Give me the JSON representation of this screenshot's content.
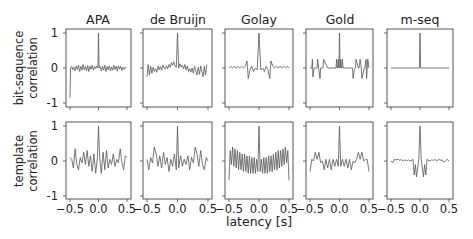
{
  "figure": {
    "xlabel": "latency [s]",
    "row_labels": [
      [
        "bit-sequence",
        "correlation"
      ],
      [
        "template",
        "correlation"
      ]
    ],
    "column_titles": [
      "APA",
      "de Bruijn",
      "Golay",
      "Gold",
      "m-seq"
    ],
    "xticks": [
      "-0.5",
      "0.0",
      "0.5"
    ],
    "yticks": [
      "1",
      "0",
      "-1"
    ],
    "line_color": "#555555",
    "frame_color": "#444444"
  },
  "chart_data": [
    {
      "type": "line",
      "title": "APA",
      "row": "bit-sequence correlation",
      "xlabel": "latency [s]",
      "ylabel": "bit-sequence correlation",
      "xlim": [
        -0.55,
        0.55
      ],
      "ylim": [
        -1.05,
        1.1
      ],
      "x": [
        -0.5,
        -0.49,
        -0.47,
        -0.45,
        -0.43,
        -0.41,
        -0.39,
        -0.37,
        -0.35,
        -0.33,
        -0.31,
        -0.29,
        -0.27,
        -0.25,
        -0.23,
        -0.21,
        -0.19,
        -0.17,
        -0.15,
        -0.13,
        -0.11,
        -0.09,
        -0.07,
        -0.05,
        -0.03,
        -0.01,
        0.0,
        0.01,
        0.03,
        0.05,
        0.07,
        0.09,
        0.11,
        0.13,
        0.15,
        0.17,
        0.19,
        0.21,
        0.23,
        0.25,
        0.27,
        0.29,
        0.31,
        0.33,
        0.35,
        0.37,
        0.39,
        0.41,
        0.43,
        0.45,
        0.47,
        0.49
      ],
      "y": [
        -0.85,
        0.0,
        0.05,
        -0.05,
        0.02,
        -0.08,
        0.06,
        -0.04,
        0.08,
        -0.1,
        0.05,
        -0.06,
        0.1,
        -0.05,
        0.04,
        -0.08,
        0.07,
        -0.1,
        0.05,
        -0.03,
        0.08,
        -0.06,
        0.04,
        -0.02,
        0.06,
        0.0,
        1.0,
        0.0,
        0.04,
        -0.08,
        0.05,
        -0.06,
        0.08,
        -0.1,
        0.04,
        -0.05,
        0.06,
        -0.08,
        0.03,
        -0.06,
        0.08,
        -0.04,
        0.05,
        -0.09,
        0.06,
        -0.03,
        0.05,
        -0.07,
        0.02,
        -0.04,
        0.03,
        0.0
      ]
    },
    {
      "type": "line",
      "title": "de Bruijn",
      "row": "bit-sequence correlation",
      "xlim": [
        -0.55,
        0.55
      ],
      "ylim": [
        -1.05,
        1.1
      ],
      "x": [
        -0.5,
        -0.48,
        -0.46,
        -0.44,
        -0.42,
        -0.4,
        -0.38,
        -0.36,
        -0.34,
        -0.32,
        -0.3,
        -0.28,
        -0.26,
        -0.24,
        -0.22,
        -0.2,
        -0.18,
        -0.16,
        -0.14,
        -0.12,
        -0.1,
        -0.08,
        -0.06,
        -0.04,
        -0.02,
        0.0,
        0.02,
        0.04,
        0.06,
        0.08,
        0.1,
        0.12,
        0.14,
        0.16,
        0.18,
        0.2,
        0.22,
        0.24,
        0.26,
        0.28,
        0.3,
        0.32,
        0.34,
        0.36,
        0.38,
        0.4,
        0.42,
        0.44,
        0.46,
        0.48
      ],
      "y": [
        -0.25,
        0.1,
        -0.2,
        0.05,
        -0.15,
        0.02,
        -0.1,
        -0.02,
        -0.12,
        0.05,
        -0.05,
        0.04,
        -0.06,
        0.08,
        0.0,
        -0.03,
        0.06,
        -0.02,
        0.1,
        0.02,
        0.15,
        0.08,
        0.18,
        0.05,
        0.02,
        1.0,
        0.0,
        0.12,
        0.03,
        0.08,
        -0.02,
        0.1,
        -0.05,
        0.06,
        -0.1,
        -0.02,
        -0.12,
        0.0,
        -0.15,
        0.05,
        -0.08,
        -0.2,
        0.02,
        -0.18,
        0.06,
        -0.1,
        -0.25,
        0.05,
        -0.2,
        0.1
      ]
    },
    {
      "type": "line",
      "title": "Golay",
      "row": "bit-sequence correlation",
      "xlim": [
        -0.55,
        0.55
      ],
      "ylim": [
        -1.05,
        1.1
      ],
      "x": [
        -0.5,
        -0.47,
        -0.44,
        -0.41,
        -0.38,
        -0.35,
        -0.32,
        -0.29,
        -0.26,
        -0.23,
        -0.2,
        -0.19,
        -0.18,
        -0.15,
        -0.12,
        -0.09,
        -0.06,
        -0.03,
        0.0,
        0.03,
        0.06,
        0.09,
        0.12,
        0.15,
        0.18,
        0.19,
        0.2,
        0.23,
        0.26,
        0.29,
        0.32,
        0.35,
        0.38,
        0.41,
        0.44,
        0.47,
        0.5
      ],
      "y": [
        0.0,
        0.05,
        0.0,
        0.05,
        0.0,
        0.05,
        0.0,
        0.05,
        0.0,
        0.05,
        0.2,
        0.0,
        -0.3,
        -0.05,
        0.05,
        -0.1,
        0.0,
        -0.05,
        1.0,
        -0.05,
        0.0,
        -0.1,
        0.05,
        -0.05,
        -0.3,
        0.0,
        0.2,
        0.05,
        0.0,
        0.05,
        0.0,
        0.05,
        0.0,
        0.05,
        0.0,
        0.05,
        0.0
      ]
    },
    {
      "type": "line",
      "title": "Gold",
      "row": "bit-sequence correlation",
      "xlim": [
        -0.55,
        0.55
      ],
      "ylim": [
        -1.05,
        1.1
      ],
      "x": [
        -0.5,
        -0.47,
        -0.46,
        -0.45,
        -0.43,
        -0.42,
        -0.38,
        -0.37,
        -0.35,
        -0.33,
        -0.32,
        -0.3,
        -0.28,
        -0.27,
        -0.2,
        -0.06,
        -0.05,
        -0.04,
        -0.03,
        -0.02,
        -0.01,
        0.0,
        0.01,
        0.02,
        0.03,
        0.04,
        0.05,
        0.06,
        0.2,
        0.22,
        0.23,
        0.25,
        0.27,
        0.28,
        0.32,
        0.33,
        0.35,
        0.37,
        0.38,
        0.42,
        0.43,
        0.45,
        0.46,
        0.47,
        0.48,
        0.5
      ],
      "y": [
        0.0,
        0.0,
        0.25,
        -0.25,
        0.0,
        0.0,
        0.0,
        0.25,
        -0.05,
        -0.3,
        0.0,
        0.0,
        0.0,
        0.25,
        0.0,
        0.0,
        0.25,
        0.0,
        0.0,
        0.25,
        0.0,
        1.0,
        0.0,
        0.25,
        0.0,
        0.0,
        0.25,
        0.0,
        0.0,
        0.0,
        -0.3,
        -0.05,
        0.0,
        0.25,
        0.0,
        0.0,
        0.25,
        0.0,
        -0.3,
        0.0,
        0.0,
        0.25,
        -0.3,
        0.0,
        0.25,
        0.0
      ]
    },
    {
      "type": "line",
      "title": "m-seq",
      "row": "bit-sequence correlation",
      "xlim": [
        -0.55,
        0.55
      ],
      "ylim": [
        -1.05,
        1.1
      ],
      "x": [
        -0.5,
        -0.01,
        0.0,
        0.01,
        0.5
      ],
      "y": [
        0.0,
        0.0,
        1.0,
        0.0,
        0.0
      ]
    },
    {
      "type": "line",
      "title": "APA",
      "row": "template correlation",
      "xlim": [
        -0.55,
        0.55
      ],
      "ylim": [
        -1.05,
        1.1
      ],
      "x": [
        -0.5,
        -0.47,
        -0.44,
        -0.41,
        -0.38,
        -0.35,
        -0.32,
        -0.29,
        -0.26,
        -0.23,
        -0.2,
        -0.17,
        -0.14,
        -0.11,
        -0.08,
        -0.05,
        -0.02,
        0.0,
        0.02,
        0.05,
        0.08,
        0.11,
        0.14,
        0.17,
        0.2,
        0.23,
        0.26,
        0.29,
        0.32,
        0.35,
        0.38,
        0.41,
        0.44,
        0.47,
        0.5
      ],
      "y": [
        0.1,
        0.05,
        -0.2,
        0.35,
        -0.1,
        -0.25,
        0.1,
        -0.05,
        0.25,
        -0.1,
        0.3,
        -0.15,
        0.15,
        -0.3,
        0.2,
        -0.35,
        0.1,
        1.0,
        0.1,
        -0.35,
        0.25,
        -0.25,
        0.3,
        -0.2,
        0.05,
        -0.1,
        0.2,
        -0.15,
        0.05,
        -0.05,
        0.35,
        -0.05,
        -0.25,
        0.15,
        0.1
      ]
    },
    {
      "type": "line",
      "title": "de Bruijn",
      "row": "template correlation",
      "xlim": [
        -0.55,
        0.55
      ],
      "ylim": [
        -1.05,
        1.1
      ],
      "x": [
        -0.5,
        -0.47,
        -0.44,
        -0.41,
        -0.38,
        -0.35,
        -0.32,
        -0.29,
        -0.26,
        -0.23,
        -0.2,
        -0.17,
        -0.14,
        -0.11,
        -0.08,
        -0.05,
        -0.02,
        0.0,
        0.02,
        0.05,
        0.08,
        0.11,
        0.14,
        0.17,
        0.2,
        0.23,
        0.26,
        0.29,
        0.32,
        0.35,
        0.38,
        0.41,
        0.44,
        0.47,
        0.5
      ],
      "y": [
        0.05,
        -0.25,
        0.1,
        -0.05,
        0.4,
        0.2,
        -0.15,
        0.15,
        -0.2,
        0.25,
        -0.1,
        0.1,
        -0.3,
        0.05,
        -0.15,
        0.2,
        -0.25,
        1.0,
        -0.2,
        0.15,
        -0.15,
        0.05,
        -0.1,
        0.15,
        -0.25,
        0.1,
        -0.05,
        0.4,
        0.2,
        -0.15,
        0.3,
        -0.1,
        -0.25,
        0.1,
        0.0
      ]
    },
    {
      "type": "line",
      "title": "Golay",
      "row": "template correlation",
      "xlim": [
        -0.55,
        0.55
      ],
      "ylim": [
        -1.05,
        1.1
      ],
      "x": [
        -0.5,
        -0.48,
        -0.46,
        -0.44,
        -0.42,
        -0.4,
        -0.38,
        -0.36,
        -0.34,
        -0.32,
        -0.3,
        -0.28,
        -0.26,
        -0.24,
        -0.22,
        -0.2,
        -0.18,
        -0.16,
        -0.14,
        -0.12,
        -0.1,
        -0.08,
        -0.06,
        -0.04,
        -0.02,
        0.0,
        0.02,
        0.04,
        0.06,
        0.08,
        0.1,
        0.12,
        0.14,
        0.16,
        0.18,
        0.2,
        0.22,
        0.24,
        0.26,
        0.28,
        0.3,
        0.32,
        0.34,
        0.36,
        0.38,
        0.4,
        0.42,
        0.44,
        0.46,
        0.48,
        0.5
      ],
      "y": [
        -0.55,
        0.3,
        -0.1,
        0.4,
        -0.15,
        0.35,
        -0.2,
        0.3,
        -0.25,
        0.25,
        -0.25,
        0.2,
        -0.3,
        0.2,
        -0.3,
        0.15,
        -0.35,
        0.15,
        -0.35,
        0.1,
        -0.35,
        0.1,
        -0.35,
        0.05,
        -0.3,
        1.0,
        -0.3,
        0.05,
        -0.35,
        0.1,
        -0.35,
        0.1,
        -0.35,
        0.15,
        -0.3,
        0.15,
        -0.3,
        0.2,
        -0.25,
        0.25,
        -0.25,
        0.3,
        -0.2,
        0.3,
        -0.15,
        0.35,
        -0.1,
        0.4,
        -0.05,
        0.3,
        -0.55
      ]
    },
    {
      "type": "line",
      "title": "Gold",
      "row": "template correlation",
      "xlim": [
        -0.55,
        0.55
      ],
      "ylim": [
        -1.05,
        1.1
      ],
      "x": [
        -0.5,
        -0.47,
        -0.44,
        -0.41,
        -0.38,
        -0.35,
        -0.32,
        -0.29,
        -0.26,
        -0.23,
        -0.2,
        -0.17,
        -0.14,
        -0.11,
        -0.08,
        -0.05,
        -0.02,
        0.0,
        0.02,
        0.05,
        0.08,
        0.11,
        0.14,
        0.17,
        0.2,
        0.23,
        0.26,
        0.29,
        0.32,
        0.35,
        0.38,
        0.41,
        0.44,
        0.47,
        0.5
      ],
      "y": [
        -0.3,
        0.05,
        0.0,
        0.25,
        0.05,
        0.25,
        -0.05,
        0.0,
        -0.25,
        0.05,
        -0.2,
        0.05,
        -0.25,
        0.05,
        -0.15,
        0.05,
        -0.15,
        1.0,
        -0.15,
        0.05,
        -0.15,
        0.05,
        -0.2,
        0.05,
        -0.25,
        0.0,
        -0.05,
        0.05,
        0.25,
        0.05,
        0.25,
        0.0,
        0.05,
        0.05,
        -0.3
      ]
    },
    {
      "type": "line",
      "title": "m-seq",
      "row": "template correlation",
      "xlim": [
        -0.55,
        0.55
      ],
      "ylim": [
        -1.05,
        1.1
      ],
      "x": [
        -0.5,
        -0.47,
        -0.44,
        -0.41,
        -0.38,
        -0.35,
        -0.32,
        -0.29,
        -0.26,
        -0.23,
        -0.2,
        -0.17,
        -0.14,
        -0.12,
        -0.1,
        -0.08,
        -0.06,
        -0.04,
        -0.02,
        0.0,
        0.02,
        0.04,
        0.06,
        0.08,
        0.1,
        0.12,
        0.14,
        0.17,
        0.2,
        0.23,
        0.26,
        0.29,
        0.32,
        0.35,
        0.38,
        0.41,
        0.44,
        0.47,
        0.5
      ],
      "y": [
        0.0,
        -0.05,
        0.05,
        0.03,
        0.05,
        0.02,
        0.04,
        0.0,
        0.03,
        0.01,
        0.03,
        0.0,
        0.02,
        0.05,
        -0.4,
        -0.1,
        -0.45,
        -0.2,
        0.05,
        1.0,
        0.05,
        -0.2,
        -0.45,
        -0.1,
        -0.4,
        0.05,
        0.02,
        0.0,
        0.03,
        0.02,
        0.04,
        0.0,
        0.05,
        0.02,
        0.03,
        -0.03,
        0.0,
        0.05,
        0.0
      ]
    }
  ]
}
